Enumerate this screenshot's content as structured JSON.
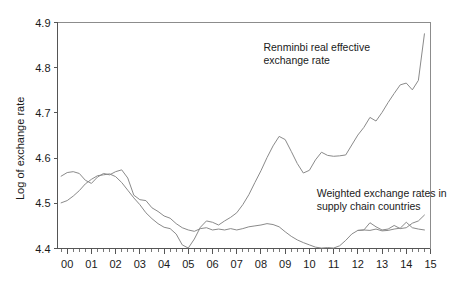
{
  "chart_data": {
    "type": "line",
    "title": "",
    "xlabel": "",
    "ylabel": "Log of exchange rate",
    "xlim": [
      1999.6,
      2015.0
    ],
    "ylim": [
      4.4,
      4.9
    ],
    "yticks": [
      4.4,
      4.5,
      4.6,
      4.7,
      4.8,
      4.9
    ],
    "ytick_labels": [
      "4.4",
      "4.5",
      "4.6",
      "4.7",
      "4.8",
      "4.9"
    ],
    "xticks": [
      2000,
      2001,
      2002,
      2003,
      2004,
      2005,
      2006,
      2007,
      2008,
      2009,
      2010,
      2011,
      2012,
      2013,
      2014,
      2015
    ],
    "xtick_labels": [
      "00",
      "01",
      "02",
      "03",
      "04",
      "05",
      "06",
      "07",
      "08",
      "09",
      "10",
      "11",
      "12",
      "13",
      "14",
      "15"
    ],
    "minor_ticks_per_interval": 4,
    "grid": false,
    "legend": "annotations-inline",
    "line_color": "#8a8a8a",
    "axis_color": "#555555",
    "background": "#ffffff",
    "annotations": [
      {
        "name": "renminbi-reer-label",
        "text_lines": [
          "Renminbi real effective",
          "exchange rate"
        ],
        "x": 2008.1,
        "y": 4.838
      },
      {
        "name": "supply-chain-label",
        "text_lines": [
          "Weighted exchange rates in",
          "supply chain countries"
        ],
        "x": 2010.3,
        "y": 4.513
      }
    ],
    "series": [
      {
        "name": "Renminbi real effective exchange rate",
        "color": "#8a8a8a",
        "x": [
          1999.75,
          2000.0,
          2000.25,
          2000.5,
          2000.75,
          2001.0,
          2001.25,
          2001.5,
          2001.75,
          2002.0,
          2002.25,
          2002.5,
          2002.75,
          2003.0,
          2003.25,
          2003.5,
          2003.75,
          2004.0,
          2004.25,
          2004.5,
          2004.75,
          2005.0,
          2005.25,
          2005.5,
          2005.75,
          2006.0,
          2006.25,
          2006.5,
          2006.75,
          2007.0,
          2007.25,
          2007.5,
          2007.75,
          2008.0,
          2008.25,
          2008.5,
          2008.75,
          2009.0,
          2009.25,
          2009.5,
          2009.75,
          2010.0,
          2010.25,
          2010.5,
          2010.75,
          2011.0,
          2011.25,
          2011.5,
          2011.75,
          2012.0,
          2012.25,
          2012.5,
          2012.75,
          2013.0,
          2013.25,
          2013.5,
          2013.75,
          2014.0,
          2014.25,
          2014.5,
          2014.75
        ],
        "y": [
          4.501,
          4.506,
          4.516,
          4.528,
          4.543,
          4.553,
          4.561,
          4.563,
          4.565,
          4.559,
          4.546,
          4.529,
          4.512,
          4.497,
          4.479,
          4.466,
          4.455,
          4.447,
          4.444,
          4.432,
          4.408,
          4.401,
          4.421,
          4.447,
          4.461,
          4.458,
          4.452,
          4.461,
          4.469,
          4.479,
          4.497,
          4.519,
          4.546,
          4.572,
          4.601,
          4.627,
          4.648,
          4.641,
          4.615,
          4.588,
          4.567,
          4.573,
          4.596,
          4.613,
          4.606,
          4.604,
          4.605,
          4.607,
          4.629,
          4.651,
          4.668,
          4.69,
          4.682,
          4.701,
          4.723,
          4.743,
          4.762,
          4.766,
          4.751,
          4.772,
          4.875
        ]
      },
      {
        "name": "Weighted exchange rates in supply chain countries",
        "color": "#8a8a8a",
        "x": [
          1999.75,
          2000.0,
          2000.25,
          2000.5,
          2000.75,
          2001.0,
          2001.25,
          2001.5,
          2001.75,
          2002.0,
          2002.25,
          2002.5,
          2002.75,
          2003.0,
          2003.25,
          2003.5,
          2003.75,
          2004.0,
          2004.25,
          2004.5,
          2004.75,
          2005.0,
          2005.25,
          2005.5,
          2005.75,
          2006.0,
          2006.25,
          2006.5,
          2006.75,
          2007.0,
          2007.25,
          2007.5,
          2007.75,
          2008.0,
          2008.25,
          2008.5,
          2008.75,
          2009.0,
          2009.25,
          2009.5,
          2009.75,
          2010.0,
          2010.25,
          2010.5,
          2010.75,
          2011.0,
          2011.25,
          2011.5,
          2011.75,
          2012.0,
          2012.25,
          2012.5,
          2012.75,
          2013.0,
          2013.25,
          2013.5,
          2013.75,
          2014.0,
          2014.25,
          2014.5,
          2014.75
        ],
        "y": [
          4.56,
          4.568,
          4.57,
          4.566,
          4.551,
          4.544,
          4.558,
          4.566,
          4.563,
          4.57,
          4.574,
          4.556,
          4.518,
          4.508,
          4.506,
          4.49,
          4.482,
          4.472,
          4.467,
          4.455,
          4.446,
          4.441,
          4.438,
          4.444,
          4.446,
          4.441,
          4.443,
          4.441,
          4.444,
          4.441,
          4.444,
          4.448,
          4.45,
          4.452,
          4.455,
          4.453,
          4.448,
          4.437,
          4.427,
          4.419,
          4.413,
          4.408,
          4.403,
          4.401,
          4.402,
          4.401,
          4.406,
          4.418,
          4.432,
          4.44,
          4.441,
          4.44,
          4.443,
          4.439,
          4.44,
          4.443,
          4.445,
          4.458,
          4.446,
          4.443,
          4.441
        ]
      },
      {
        "name": "Weighted exchange rates in supply chain countries (tail)",
        "color": "#8a8a8a",
        "x": [
          2012.0,
          2012.25,
          2012.5,
          2012.75,
          2013.0,
          2013.25,
          2013.5,
          2013.75,
          2014.0,
          2014.25,
          2014.5,
          2014.75
        ],
        "y": [
          4.44,
          4.441,
          4.457,
          4.448,
          4.441,
          4.443,
          4.451,
          4.444,
          4.446,
          4.456,
          4.461,
          4.474
        ]
      }
    ]
  }
}
